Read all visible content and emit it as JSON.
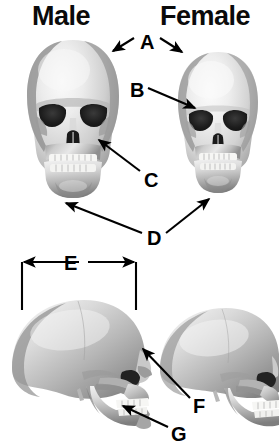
{
  "figure": {
    "type": "anatomical-comparison-diagram",
    "background_color": "#ffffff",
    "label_color": "#000000",
    "annotation_color": "#000000",
    "width": 279,
    "height": 447
  },
  "headers": [
    {
      "id": "male",
      "text": "Male",
      "x": 32,
      "y": 3
    },
    {
      "id": "female",
      "text": "Female",
      "x": 160,
      "y": 3
    }
  ],
  "labels": [
    {
      "id": "A",
      "text": "A",
      "x": 140,
      "y": 32
    },
    {
      "id": "B",
      "text": "B",
      "x": 130,
      "y": 80
    },
    {
      "id": "C",
      "text": "C",
      "x": 144,
      "y": 170
    },
    {
      "id": "D",
      "text": "D",
      "x": 147,
      "y": 228
    },
    {
      "id": "E",
      "text": "E",
      "x": 64,
      "y": 253
    },
    {
      "id": "F",
      "text": "F",
      "x": 193,
      "y": 396
    },
    {
      "id": "G",
      "text": "G",
      "x": 171,
      "y": 424
    }
  ],
  "specimens": [
    {
      "id": "male-anterior",
      "view": "anterior",
      "sex": "male",
      "column": "left",
      "row": "top"
    },
    {
      "id": "female-anterior",
      "view": "anterior",
      "sex": "female",
      "column": "right",
      "row": "top"
    },
    {
      "id": "male-lateral",
      "view": "lateral",
      "sex": "male",
      "column": "left",
      "row": "bottom"
    },
    {
      "id": "female-lateral",
      "view": "lateral",
      "sex": "female",
      "column": "right",
      "row": "bottom"
    }
  ],
  "annotations": {
    "A": {
      "label": "A",
      "target": "cranial-vault",
      "arrow_count": 2,
      "points_to": [
        "male-anterior",
        "female-anterior"
      ]
    },
    "B": {
      "label": "B",
      "target": "supraorbital-ridge",
      "arrow_count": 1,
      "points_to": [
        "female-anterior"
      ]
    },
    "C": {
      "label": "C",
      "target": "zygomatic-arch",
      "arrow_count": 1,
      "points_to": [
        "male-anterior"
      ]
    },
    "D": {
      "label": "D",
      "target": "mandible-chin",
      "arrow_count": 2,
      "points_to": [
        "male-anterior",
        "female-anterior"
      ]
    },
    "E": {
      "label": "E",
      "target": "cranial-width",
      "arrow_count": 2,
      "measurement": true,
      "points_to": [
        "male-lateral"
      ]
    },
    "F": {
      "label": "F",
      "target": "frontal-slope",
      "arrow_count": 1,
      "points_to": [
        "male-lateral"
      ]
    },
    "G": {
      "label": "G",
      "target": "mandibular-angle",
      "arrow_count": 1,
      "points_to": [
        "male-lateral"
      ]
    }
  },
  "measurement_bracket": {
    "id": "E",
    "orientation": "horizontal",
    "left_tick_x": 22,
    "right_tick_x": 136,
    "axis_y": 262,
    "tick_bottom_y": 310
  }
}
